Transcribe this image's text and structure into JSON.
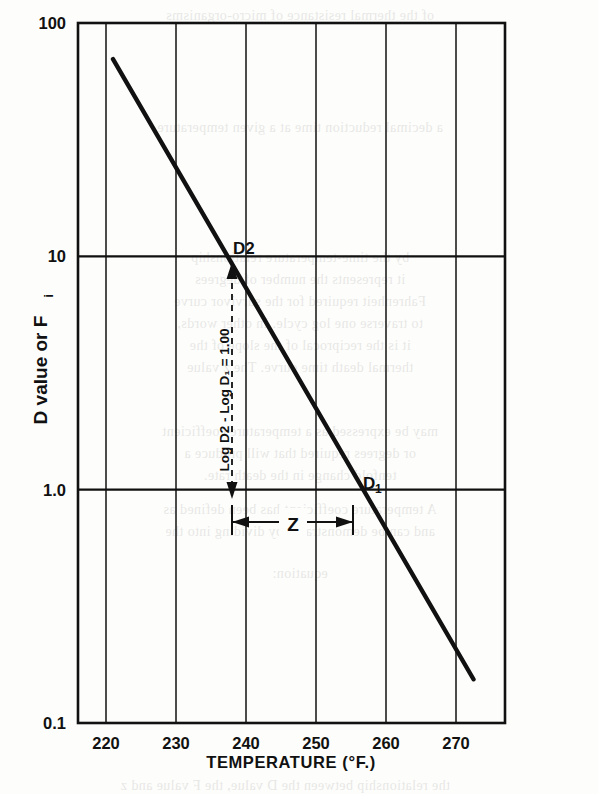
{
  "figure": {
    "background_color": "#fdfdfb",
    "ink_color": "#111111",
    "x_axis_title": "TEMPERATURE   (°F.)",
    "y_axis_title_main": "D value or F",
    "y_axis_title_sub": "i"
  },
  "annotations": {
    "d2_label": "D2",
    "d1_main": "D",
    "d1_sub": "1",
    "z_label": "Z",
    "log_diff_label": "Log D2 - Log D₁ = 1.00"
  },
  "bleed_text": [
    {
      "text": "of the thermal resistance of micro-organisms",
      "x": 300,
      "y": 8
    },
    {
      "text": "a decimal reduction time at a given temperature",
      "x": 300,
      "y": 120
    },
    {
      "text": "by the time-temperature relationship",
      "x": 300,
      "y": 250
    },
    {
      "text": "it represents the number of degrees",
      "x": 300,
      "y": 272
    },
    {
      "text": "Fahrenheit required for the survivor curve",
      "x": 300,
      "y": 294
    },
    {
      "text": "to traverse one log cycle. In other words,",
      "x": 300,
      "y": 316
    },
    {
      "text": "it is the reciprocal of the slope of the",
      "x": 300,
      "y": 338
    },
    {
      "text": "thermal death time curve. The z value",
      "x": 300,
      "y": 360
    },
    {
      "text": "may be expressed as a temperature coefficient",
      "x": 300,
      "y": 424
    },
    {
      "text": "or degrees required that will produce a",
      "x": 300,
      "y": 446
    },
    {
      "text": "tenfold change in the death rate.",
      "x": 300,
      "y": 468
    },
    {
      "text": "A temperature coefficient has been defined as",
      "x": 300,
      "y": 502
    },
    {
      "text": "and can be demonstrated by dividing into the",
      "x": 300,
      "y": 524
    },
    {
      "text": "equation:",
      "x": 300,
      "y": 566
    },
    {
      "text": "the relationship between the D value, the F value and z",
      "x": 300,
      "y": 778
    }
  ],
  "chart_data": {
    "type": "line",
    "title": "",
    "xlabel": "TEMPERATURE   (°F.)",
    "ylabel": "D value or Fi",
    "xlim": [
      216,
      277
    ],
    "ylim": [
      0.1,
      100
    ],
    "yscale": "log",
    "grid": true,
    "x_ticks": [
      220,
      230,
      240,
      250,
      260,
      270
    ],
    "y_ticks": [
      "100",
      "10",
      "1.0",
      "0.1"
    ],
    "y_tick_values": [
      100,
      10,
      1,
      0.1
    ],
    "series": [
      {
        "name": "thermal death time curve",
        "x": [
          221.0,
          272.5
        ],
        "y": [
          70,
          0.154
        ],
        "points_labeled": [
          {
            "label": "D2",
            "x": 231.7,
            "y": 10
          },
          {
            "label": "D1",
            "x": 248.7,
            "y": 1.0
          }
        ]
      }
    ],
    "annotations": [
      {
        "name": "z-span",
        "type": "double-arrow-horizontal",
        "label": "Z",
        "x_from": 231.7,
        "x_to": 248.7,
        "y": 0.85
      },
      {
        "name": "log-decade-span",
        "type": "double-arrow-vertical",
        "label": "Log D2 - Log D₁ = 1.00",
        "x": 231.7,
        "y_from": 10,
        "y_to": 1.0
      }
    ]
  }
}
